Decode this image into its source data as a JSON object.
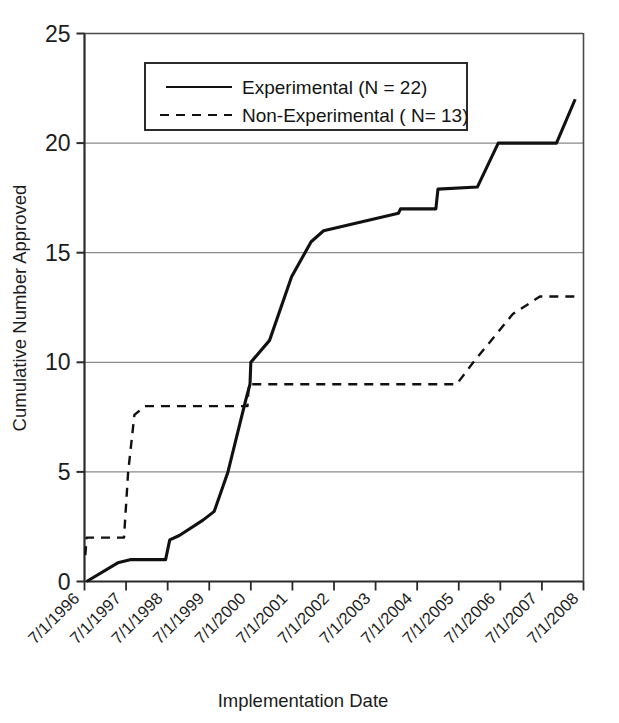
{
  "chart_data": {
    "type": "line",
    "title": "",
    "xlabel": "Implementation Date",
    "ylabel": "Cumulative Number Approved",
    "ylim": [
      0,
      25
    ],
    "yticks": [
      0,
      5,
      10,
      15,
      20,
      25
    ],
    "ytick_labels": [
      "0",
      "5",
      "10",
      "15",
      "20",
      "25"
    ],
    "grid": "horizontal",
    "legend_position": "upper-left-inside",
    "categories": [
      "7/1/1996",
      "7/1/1997",
      "7/1/1998",
      "7/1/1999",
      "7/1/2000",
      "7/1/2001",
      "7/1/2002",
      "7/1/2003",
      "7/1/2004",
      "7/1/2005",
      "7/1/2006",
      "7/1/2007",
      "7/1/2008"
    ],
    "xlim": [
      1996.5,
      2008.5
    ],
    "series": [
      {
        "name": "Experimental (N = 22)",
        "style": "solid",
        "color": "#111111",
        "final_value": 22,
        "n": 22,
        "points": [
          [
            1996.55,
            0
          ],
          [
            1997.3,
            0.85
          ],
          [
            1997.62,
            1.0
          ],
          [
            1998.45,
            1.0
          ],
          [
            1998.55,
            1.9
          ],
          [
            1998.78,
            2.1
          ],
          [
            1999.35,
            2.8
          ],
          [
            1999.62,
            3.2
          ],
          [
            1999.95,
            5.0
          ],
          [
            2000.38,
            8.3
          ],
          [
            2000.48,
            9.0
          ],
          [
            2000.5,
            10.0
          ],
          [
            2000.95,
            11.0
          ],
          [
            2001.48,
            13.9
          ],
          [
            2001.95,
            15.5
          ],
          [
            2002.25,
            16.0
          ],
          [
            2004.05,
            16.8
          ],
          [
            2004.1,
            17.0
          ],
          [
            2004.95,
            17.0
          ],
          [
            2005.0,
            17.9
          ],
          [
            2005.95,
            18.0
          ],
          [
            2006.45,
            20.0
          ],
          [
            2007.85,
            20.0
          ],
          [
            2008.3,
            22.0
          ]
        ]
      },
      {
        "name": "Non-Experimental ( N= 13)",
        "style": "dashed",
        "color": "#111111",
        "final_value": 13,
        "n": 13,
        "points": [
          [
            1996.52,
            1.2
          ],
          [
            1996.55,
            2.0
          ],
          [
            1997.45,
            2.0
          ],
          [
            1997.55,
            5.0
          ],
          [
            1997.7,
            7.6
          ],
          [
            1997.95,
            8.0
          ],
          [
            1999.9,
            8.0
          ],
          [
            2000.42,
            8.0
          ],
          [
            2000.45,
            9.0
          ],
          [
            2005.45,
            9.0
          ],
          [
            2005.85,
            10.0
          ],
          [
            2006.8,
            12.2
          ],
          [
            2007.45,
            13.0
          ],
          [
            2008.3,
            13.0
          ]
        ]
      }
    ]
  },
  "legend": {
    "entries": [
      {
        "label": "Experimental (N = 22)",
        "style": "solid"
      },
      {
        "label": "Non-Experimental ( N= 13)",
        "style": "dashed"
      }
    ]
  }
}
